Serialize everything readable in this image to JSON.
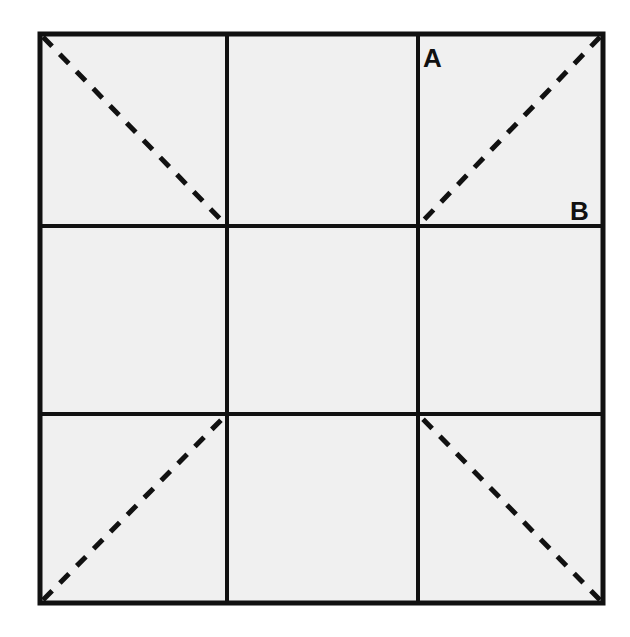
{
  "figure": {
    "type": "grid-diagram",
    "colors": {
      "fill": "#f0f0f0",
      "stroke": "#111111",
      "background": "#ffffff"
    },
    "outer_square": {
      "x1": 40,
      "y1": 34,
      "x2": 603,
      "y2": 603
    },
    "vertical_lines_x": [
      227,
      418
    ],
    "horizontal_lines_y": [
      226,
      414
    ],
    "dashed_diagonals": [
      {
        "from": [
          43,
          37
        ],
        "to": [
          227,
          226
        ]
      },
      {
        "from": [
          600,
          37
        ],
        "to": [
          418,
          226
        ]
      },
      {
        "from": [
          43,
          600
        ],
        "to": [
          227,
          414
        ]
      },
      {
        "from": [
          600,
          600
        ],
        "to": [
          418,
          414
        ]
      }
    ],
    "labels": [
      {
        "text": "A",
        "x": 423,
        "y": 67
      },
      {
        "text": "B",
        "x": 570,
        "y": 220
      }
    ]
  }
}
